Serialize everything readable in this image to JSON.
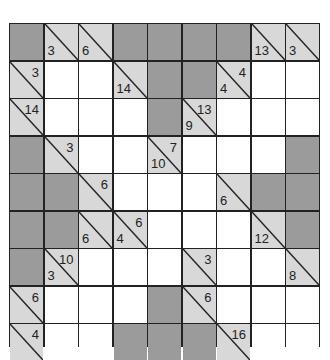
{
  "puzzle": {
    "type": "kakuro",
    "columns": 9,
    "rows_visible": 9,
    "colors": {
      "block": "#9b9b9b",
      "clue": "#d8d8d8",
      "entry": "#ffffff",
      "line": "#222222"
    },
    "grid": [
      [
        {
          "t": "dark"
        },
        {
          "t": "clue",
          "down": "3"
        },
        {
          "t": "clue",
          "down": "6"
        },
        {
          "t": "dark"
        },
        {
          "t": "dark"
        },
        {
          "t": "dark"
        },
        {
          "t": "dark"
        },
        {
          "t": "clue",
          "down": "13"
        },
        {
          "t": "clue",
          "down": "3"
        }
      ],
      [
        {
          "t": "clue",
          "across": "3"
        },
        {
          "t": "white"
        },
        {
          "t": "white"
        },
        {
          "t": "clue",
          "down": "14"
        },
        {
          "t": "dark"
        },
        {
          "t": "dark"
        },
        {
          "t": "clue",
          "down": "4",
          "across": "4"
        },
        {
          "t": "white"
        },
        {
          "t": "white"
        }
      ],
      [
        {
          "t": "clue",
          "across": "14"
        },
        {
          "t": "white"
        },
        {
          "t": "white"
        },
        {
          "t": "white"
        },
        {
          "t": "dark"
        },
        {
          "t": "clue",
          "down": "9",
          "across": "13"
        },
        {
          "t": "white"
        },
        {
          "t": "white"
        },
        {
          "t": "white"
        }
      ],
      [
        {
          "t": "dark"
        },
        {
          "t": "clue",
          "across": "3"
        },
        {
          "t": "white"
        },
        {
          "t": "white"
        },
        {
          "t": "clue",
          "down": "10",
          "across": "7"
        },
        {
          "t": "white"
        },
        {
          "t": "white"
        },
        {
          "t": "white"
        },
        {
          "t": "dark"
        }
      ],
      [
        {
          "t": "dark"
        },
        {
          "t": "dark"
        },
        {
          "t": "clue",
          "across": "6"
        },
        {
          "t": "white"
        },
        {
          "t": "white"
        },
        {
          "t": "white"
        },
        {
          "t": "clue",
          "down": "6"
        },
        {
          "t": "dark"
        },
        {
          "t": "dark"
        }
      ],
      [
        {
          "t": "dark"
        },
        {
          "t": "dark"
        },
        {
          "t": "clue",
          "down": "6"
        },
        {
          "t": "clue",
          "down": "4",
          "across": "6"
        },
        {
          "t": "white"
        },
        {
          "t": "white"
        },
        {
          "t": "white"
        },
        {
          "t": "clue",
          "down": "12"
        },
        {
          "t": "dark"
        }
      ],
      [
        {
          "t": "dark"
        },
        {
          "t": "clue",
          "down": "3",
          "across": "10"
        },
        {
          "t": "white"
        },
        {
          "t": "white"
        },
        {
          "t": "white"
        },
        {
          "t": "clue",
          "across": "3"
        },
        {
          "t": "white"
        },
        {
          "t": "white"
        },
        {
          "t": "clue",
          "down": "8"
        }
      ],
      [
        {
          "t": "clue",
          "across": "6"
        },
        {
          "t": "white"
        },
        {
          "t": "white"
        },
        {
          "t": "white"
        },
        {
          "t": "dark"
        },
        {
          "t": "clue",
          "across": "6"
        },
        {
          "t": "white"
        },
        {
          "t": "white"
        },
        {
          "t": "white"
        }
      ],
      [
        {
          "t": "clue",
          "across": "4"
        },
        {
          "t": "white"
        },
        {
          "t": "white"
        },
        {
          "t": "dark"
        },
        {
          "t": "dark"
        },
        {
          "t": "dark"
        },
        {
          "t": "clue",
          "across": "16"
        },
        {
          "t": "white"
        },
        {
          "t": "white"
        }
      ]
    ]
  }
}
